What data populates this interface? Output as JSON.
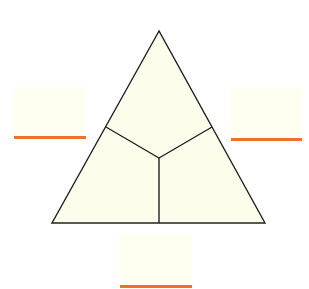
{
  "diagram": {
    "shape": "equilateral-triangle",
    "fill": "#fdfdec",
    "stroke": "#222222",
    "regions": [
      "top",
      "bottom-left",
      "bottom-right"
    ],
    "labels": {
      "left": "",
      "right": "",
      "bottom": ""
    },
    "underline_color": "#f07030"
  }
}
